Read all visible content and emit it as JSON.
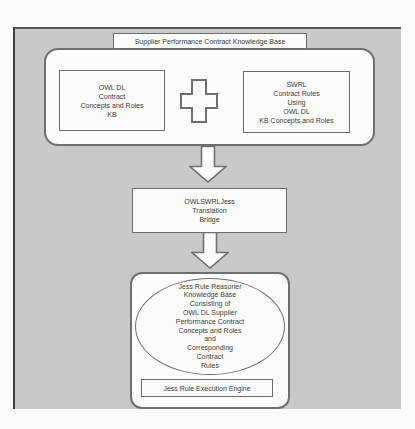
{
  "diagram": {
    "title": "Supplier Performance Contract Knowledge Base",
    "top_section": {
      "owl_box": {
        "lines": [
          "OWL DL",
          "Contract",
          "Concepts and Roles",
          "KB"
        ]
      },
      "plus_icon": "plus",
      "swrl_box": {
        "lines": [
          "SWRL",
          "Contract Rules",
          "Using",
          "OWL DL",
          "KB Concepts and Roles"
        ]
      }
    },
    "bridge_box": {
      "lines": [
        "OWLSWRLJess",
        "Translation",
        "Bridge"
      ]
    },
    "bottom_section": {
      "ellipse_lines": [
        "Jess Rule Reasoner",
        "Knowledge Base",
        "Consisting of",
        "OWL DL Supplier",
        "Performance Contract",
        "Concepts and Roles",
        "and",
        "Corresponding",
        "Contract",
        "Rules"
      ],
      "engine_label": "Jess Rule Execution Engine"
    },
    "colors": {
      "background_gray": "#c9c9c9",
      "box_fill": "#fcfcfb",
      "border": "#6f6f6f",
      "text": "#3a3a3a"
    }
  }
}
